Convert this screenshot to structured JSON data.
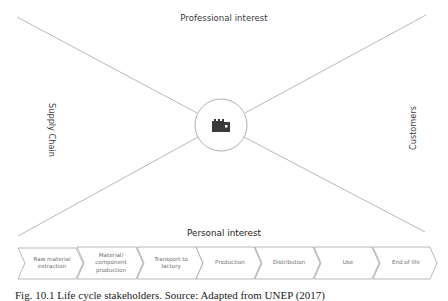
{
  "figure": {
    "labels": {
      "top": "Professional interest",
      "bottom": "Personal interest",
      "left": "Supply Chain",
      "right": "Customers"
    },
    "center_icon": "factory-icon",
    "stages": [
      {
        "label": "Raw material extraction"
      },
      {
        "label": "Material/ component production"
      },
      {
        "label": "Transport to factory"
      },
      {
        "label": "Production"
      },
      {
        "label": "Distribution"
      },
      {
        "label": "Use"
      },
      {
        "label": "End of life"
      }
    ],
    "caption": "Fig. 10.1 Life cycle stakeholders. Source: Adapted from UNEP (2017)",
    "colors": {
      "line": "#9a9a9a",
      "icon": "#3a3a3a",
      "chevron_stroke": "#8a8a8a"
    }
  }
}
